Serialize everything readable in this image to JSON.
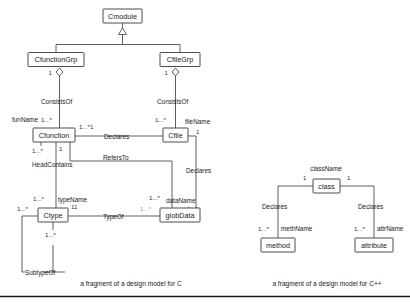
{
  "figure": {
    "background_color": "#ffffff",
    "line_color": "#4d4d4d",
    "text_color": "#1a1a1a",
    "faint_color": "#9a9a9a",
    "captions": {
      "left": "a fragment of a design model for C",
      "right": "a fragment of a design model for C++"
    }
  },
  "c_model": {
    "classes": {
      "cmodule": "Cmodule",
      "cfunctiongrp": "CfunctionGrp",
      "cfilegrp": "CfileGrp",
      "cfunction": "Cfunction",
      "cfile": "Cfile",
      "ctype": "Ctype",
      "globdata": "globData"
    },
    "associations": {
      "consists_of_fun": "ConsistsOf",
      "consists_of_file": "ConsistsOf",
      "declares_fun_file": "Declares",
      "refers_to": "RefersTo",
      "declares_file_data": "Declares",
      "head_contains": "HeadContains",
      "type_of": "TypeOf",
      "subtype_of": "SubtypeOf"
    },
    "roles": {
      "fun_name": "funName",
      "file_name": "fileName",
      "type_name": "typeName",
      "data_name": "dataName"
    },
    "multiplicities": {
      "grp_fun_one": "1",
      "grp_file_one": "1",
      "fun_many": "1...*",
      "file_many": "1...*",
      "declares_fun_side": "1...*1",
      "cfile_one": "1",
      "cfunction_one": "1",
      "head_contains_many": "1...*",
      "ctype_many": "1...*",
      "ctype_left_many": "1...*",
      "ctype_sub_many": "1...*",
      "ctype_typeof": "11",
      "typeof_glob_many": "1...*",
      "globdata_many": "1...*",
      "declares_data_many": "1...*"
    }
  },
  "cpp_model": {
    "classes": {
      "klass": "class",
      "method": "method",
      "attribute": "attribute"
    },
    "associations": {
      "declares_method": "Declares",
      "declares_attribute": "Declares"
    },
    "roles": {
      "class_name": "className",
      "meth_name": "methName",
      "attr_name": "attrName"
    },
    "multiplicities": {
      "class_left_one": "1",
      "class_right_one": "1",
      "method_many": "1...*",
      "attribute_many": "1...*"
    }
  }
}
